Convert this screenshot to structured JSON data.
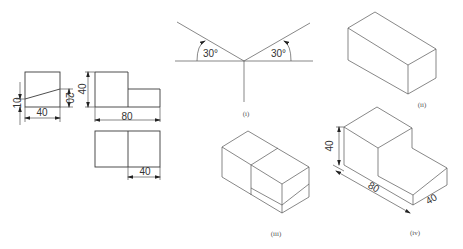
{
  "figure": {
    "orthographic": {
      "side_view": {
        "dim_height_left": "10",
        "dim_height_right": "20",
        "dim_width": "40"
      },
      "front_view": {
        "dim_height": "40",
        "dim_width": "80"
      },
      "top_view": {
        "dim_width": "40"
      }
    },
    "panel_i": {
      "label": "(i)",
      "angle_left": "30°",
      "angle_right": "30°"
    },
    "panel_ii": {
      "label": "(ii)"
    },
    "panel_iii": {
      "label": "(iii)"
    },
    "panel_iv": {
      "label": "(iv)",
      "dim_height": "40",
      "dim_length": "80",
      "dim_depth": "40"
    }
  },
  "colors": {
    "line": "#3a3a3a",
    "text": "#333333",
    "background": "#ffffff"
  }
}
